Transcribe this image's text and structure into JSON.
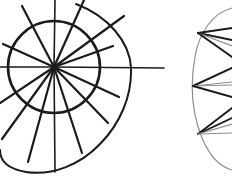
{
  "figure": {
    "background_color": "#ffffff",
    "ink_color": "#1b1b1b",
    "faint_ink_color": "#8d8d8d",
    "mid_ink_color": "#575757",
    "canvas": {
      "width": 232,
      "height": 189
    }
  },
  "left_figure": {
    "name": "spiral-wheel",
    "hub": {
      "x": 54,
      "y": 67
    },
    "inner_circle": {
      "cx": 54,
      "cy": 67,
      "r": 46,
      "stroke_width": 2.6,
      "path": "M 54 21 C 79 21 100 42 100 67 C 100 92 79 113 54 113 C 29 113 8 92 8 67 C 8 42 29 21 54 21 Z"
    },
    "outer_spiral": {
      "stroke_width": 2.0,
      "path": "M 76 4 C 108 16 130 42 131 68 C 132 96 120 124 100 144 C 80 165 52 176 26 172 C 8 169 0 161 0 150"
    },
    "spokes": [
      {
        "id": "spoke-n",
        "x1": 54,
        "y1": 67,
        "x2": 55,
        "y2": 0,
        "w": 1.6
      },
      {
        "id": "spoke-nne",
        "x1": 54,
        "y1": 67,
        "x2": 84,
        "y2": 0,
        "w": 2.2
      },
      {
        "id": "spoke-ne",
        "x1": 54,
        "y1": 67,
        "x2": 124,
        "y2": 16,
        "w": 2.2
      },
      {
        "id": "spoke-ene",
        "x1": 54,
        "y1": 67,
        "x2": 113,
        "y2": 46,
        "w": 2.2
      },
      {
        "id": "spoke-e",
        "x1": 54,
        "y1": 67,
        "x2": 164,
        "y2": 68,
        "w": 1.6
      },
      {
        "id": "spoke-ese",
        "x1": 54,
        "y1": 67,
        "x2": 119,
        "y2": 97,
        "w": 2.2
      },
      {
        "id": "spoke-se",
        "x1": 54,
        "y1": 67,
        "x2": 108,
        "y2": 123,
        "w": 2.2
      },
      {
        "id": "spoke-sse",
        "x1": 54,
        "y1": 67,
        "x2": 82,
        "y2": 153,
        "w": 2.2
      },
      {
        "id": "spoke-s",
        "x1": 54,
        "y1": 67,
        "x2": 55,
        "y2": 172,
        "w": 1.6
      },
      {
        "id": "spoke-ssw",
        "x1": 54,
        "y1": 67,
        "x2": 28,
        "y2": 162,
        "w": 2.2
      },
      {
        "id": "spoke-sw",
        "x1": 54,
        "y1": 67,
        "x2": 2,
        "y2": 139,
        "w": 2.2
      },
      {
        "id": "spoke-wsw",
        "x1": 54,
        "y1": 67,
        "x2": 0,
        "y2": 103,
        "w": 2.2
      },
      {
        "id": "spoke-w",
        "x1": 54,
        "y1": 67,
        "x2": 0,
        "y2": 67,
        "w": 1.6
      },
      {
        "id": "spoke-wnw",
        "x1": 54,
        "y1": 67,
        "x2": 3,
        "y2": 44,
        "w": 2.2
      },
      {
        "id": "spoke-nw",
        "x1": 54,
        "y1": 67,
        "x2": 22,
        "y2": 6,
        "w": 2.2
      }
    ]
  },
  "right_figure": {
    "name": "partial-circle-fan",
    "arc": {
      "stroke_width": 1.2,
      "path": "M 232 8 C 213 13 199 32 195 57 C 190 84 192 113 202 138 C 210 157 221 167 232 170"
    },
    "fan_clusters": [
      {
        "id": "fan-top",
        "vertex": {
          "x": 198,
          "y": 33
        },
        "rays": [
          {
            "x": 232,
            "y": 28,
            "w": 1.9,
            "tone": "ink"
          },
          {
            "x": 232,
            "y": 40,
            "w": 1.9,
            "tone": "ink"
          },
          {
            "x": 232,
            "y": 46,
            "w": 1.2,
            "tone": "faint"
          },
          {
            "x": 232,
            "y": 57,
            "w": 1.9,
            "tone": "ink"
          }
        ]
      },
      {
        "id": "fan-middle",
        "vertex": {
          "x": 193,
          "y": 86
        },
        "rays": [
          {
            "x": 232,
            "y": 68,
            "w": 2.0,
            "tone": "ink"
          },
          {
            "x": 232,
            "y": 82,
            "w": 1.2,
            "tone": "faint"
          },
          {
            "x": 232,
            "y": 85,
            "w": 1.2,
            "tone": "faint"
          },
          {
            "x": 232,
            "y": 97,
            "w": 2.0,
            "tone": "ink"
          }
        ]
      },
      {
        "id": "fan-bottom",
        "vertex": {
          "x": 198,
          "y": 134
        },
        "rays": [
          {
            "x": 232,
            "y": 108,
            "w": 1.9,
            "tone": "ink"
          },
          {
            "x": 232,
            "y": 118,
            "w": 1.9,
            "tone": "ink"
          },
          {
            "x": 232,
            "y": 124,
            "w": 1.2,
            "tone": "faint"
          },
          {
            "x": 232,
            "y": 133,
            "w": 1.2,
            "tone": "faint"
          }
        ]
      }
    ]
  }
}
